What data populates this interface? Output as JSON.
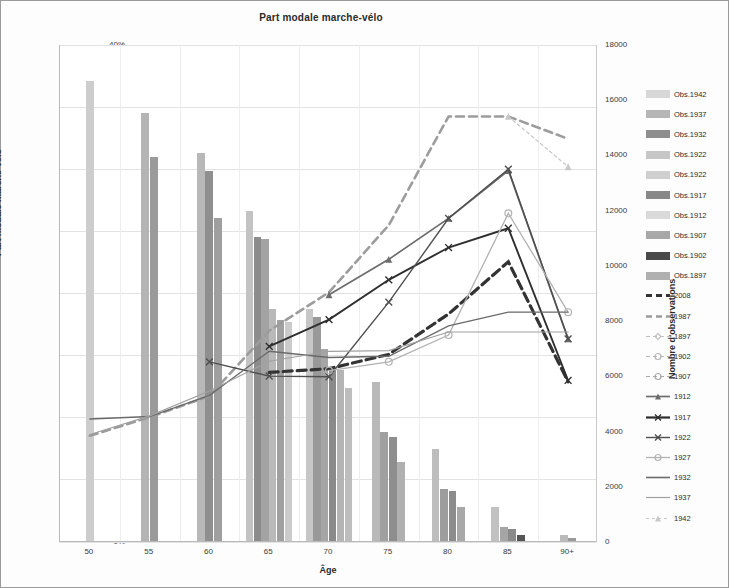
{
  "chart_data": {
    "type": "bar",
    "title": "Part modale marche-vélo",
    "xlabel": "Âge",
    "ylabel": "Part modale marche-vélo",
    "y2label": "Nombre d'observations",
    "categories": [
      "50",
      "55",
      "60",
      "65",
      "70",
      "75",
      "80",
      "85",
      "90+"
    ],
    "ylim": [
      0,
      0.4
    ],
    "ytick_labels": [
      "0%",
      "5%",
      "10%",
      "15%",
      "20%",
      "25%",
      "30%",
      "35%",
      "40%"
    ],
    "ytick_values": [
      0,
      0.05,
      0.1,
      0.15,
      0.2,
      0.25,
      0.3,
      0.35,
      0.4
    ],
    "y2lim": [
      0,
      18000
    ],
    "y2tick_labels": [
      "0",
      "2000",
      "4000",
      "6000",
      "8000",
      "10000",
      "12000",
      "14000",
      "16000",
      "18000"
    ],
    "y2tick_values": [
      0,
      2000,
      4000,
      6000,
      8000,
      10000,
      12000,
      14000,
      16000,
      18000
    ],
    "grid": true,
    "legend_position": "right",
    "bar_series": [
      {
        "name": "Obs.1942",
        "color": "#d7d7d7",
        "values": [
          16650,
          0,
          0,
          0,
          0,
          0,
          0,
          0,
          0
        ]
      },
      {
        "name": "Obs.1937",
        "color": "#b6b6b6",
        "values": [
          0,
          15500,
          0,
          0,
          0,
          0,
          0,
          0,
          0
        ]
      },
      {
        "name": "Obs.1932",
        "color": "#8e8e8e",
        "values": [
          0,
          13900,
          13400,
          0,
          0,
          0,
          0,
          0,
          0
        ]
      },
      {
        "name": "Obs.1927",
        "color": "#c6c6c6",
        "values": [
          0,
          0,
          14050,
          11700,
          0,
          0,
          0,
          0,
          0
        ]
      },
      {
        "name": "Obs.1922",
        "color": "#cfcfcf",
        "values": [
          0,
          0,
          11700,
          11950,
          0,
          0,
          0,
          0,
          0
        ]
      },
      {
        "name": "Obs.1917",
        "color": "#888888",
        "values": [
          0,
          0,
          0,
          11000,
          8400,
          0,
          0,
          0,
          0
        ]
      },
      {
        "name": "Obs.1912",
        "color": "#dadada",
        "values": [
          0,
          0,
          0,
          8000,
          8100,
          0,
          0,
          0,
          0
        ]
      },
      {
        "name": "Obs.1907",
        "color": "#a8a8a8",
        "values": [
          0,
          0,
          0,
          7950,
          6900,
          5750,
          0,
          0,
          0
        ]
      },
      {
        "name": "Obs.1902",
        "color": "#4a4a4a",
        "values": [
          0,
          0,
          0,
          0,
          6250,
          3950,
          1250,
          200,
          0
        ]
      },
      {
        "name": "Obs.1897",
        "color": "#b0b0b0",
        "values": [
          0,
          0,
          0,
          0,
          5550,
          3750,
          1900,
          500,
          100
        ]
      }
    ],
    "bar_groups": [
      {
        "category": "50",
        "bars": [
          {
            "value": 16650,
            "color": "#cdcdcd"
          }
        ]
      },
      {
        "category": "55",
        "bars": [
          {
            "value": 15500,
            "color": "#b4b4b4"
          },
          {
            "value": 13900,
            "color": "#9a9a9a"
          }
        ]
      },
      {
        "category": "60",
        "bars": [
          {
            "value": 14050,
            "color": "#b8b8b8"
          },
          {
            "value": 13400,
            "color": "#8f8f8f"
          },
          {
            "value": 11700,
            "color": "#9f9f9f"
          }
        ]
      },
      {
        "category": "65",
        "bars": [
          {
            "value": 11950,
            "color": "#c3c3c3"
          },
          {
            "value": 11000,
            "color": "#8c8c8c"
          },
          {
            "value": 10950,
            "color": "#a3a3a3"
          },
          {
            "value": 8400,
            "color": "#b9b9b9"
          },
          {
            "value": 8000,
            "color": "#a0a0a0"
          },
          {
            "value": 7950,
            "color": "#cbcbcb"
          }
        ]
      },
      {
        "category": "70",
        "bars": [
          {
            "value": 8400,
            "color": "#c6c6c6"
          },
          {
            "value": 8100,
            "color": "#999999"
          },
          {
            "value": 6950,
            "color": "#a5a5a5"
          },
          {
            "value": 6250,
            "color": "#8a8a8a"
          },
          {
            "value": 6200,
            "color": "#b4b4b4"
          },
          {
            "value": 5550,
            "color": "#bdbdbd"
          }
        ]
      },
      {
        "category": "75",
        "bars": [
          {
            "value": 5750,
            "color": "#b9b9b9"
          },
          {
            "value": 3950,
            "color": "#a0a0a0"
          },
          {
            "value": 3750,
            "color": "#8e8e8e"
          },
          {
            "value": 2850,
            "color": "#b0b0b0"
          }
        ]
      },
      {
        "category": "80",
        "bars": [
          {
            "value": 3350,
            "color": "#bdbdbd"
          },
          {
            "value": 1900,
            "color": "#9d9d9d"
          },
          {
            "value": 1800,
            "color": "#8c8c8c"
          },
          {
            "value": 1250,
            "color": "#a8a8a8"
          }
        ]
      },
      {
        "category": "85",
        "bars": [
          {
            "value": 1250,
            "color": "#c1c1c1"
          },
          {
            "value": 500,
            "color": "#a5a5a5"
          },
          {
            "value": 420,
            "color": "#8a8a8a"
          },
          {
            "value": 200,
            "color": "#555555"
          }
        ]
      },
      {
        "category": "90+",
        "bars": [
          {
            "value": 200,
            "color": "#bbbbbb"
          },
          {
            "value": 120,
            "color": "#9a9a9a"
          }
        ]
      }
    ],
    "line_series": [
      {
        "name": "2008",
        "color": "#333333",
        "width": 3.2,
        "dash": "9,5",
        "marker": "none",
        "values": [
          null,
          null,
          null,
          0.1365,
          0.1395,
          0.151,
          0.1835,
          0.2255,
          0.129
        ]
      },
      {
        "name": "1987",
        "color": "#9c9c9c",
        "width": 2.6,
        "dash": "8,5",
        "marker": "none",
        "values": [
          0.0855,
          0.1005,
          0.1175,
          0.17,
          0.201,
          0.255,
          0.3425,
          0.3425,
          0.3245
        ]
      },
      {
        "name": "1897",
        "color": "#c0c0c0",
        "width": 1.1,
        "dash": "5,3",
        "marker": "diamond",
        "values": [
          null,
          null,
          null,
          null,
          null,
          null,
          null,
          null,
          null
        ]
      },
      {
        "name": "1902",
        "color": "#b5b5b5",
        "width": 1.1,
        "dash": "5,3",
        "marker": "circle",
        "values": [
          null,
          null,
          null,
          null,
          null,
          null,
          null,
          null,
          null
        ]
      },
      {
        "name": "1907",
        "color": "#a9a9a9",
        "width": 1.1,
        "dash": "5,3",
        "marker": "circle",
        "values": [
          null,
          null,
          null,
          null,
          null,
          null,
          null,
          null,
          null
        ]
      },
      {
        "name": "1912",
        "color": "#6d6d6d",
        "width": 1.7,
        "dash": "none",
        "marker": "triangle",
        "values": [
          null,
          null,
          null,
          null,
          0.199,
          0.2275,
          0.2605,
          0.299,
          0.1635
        ]
      },
      {
        "name": "1917",
        "color": "#2e2e2e",
        "width": 1.9,
        "dash": "none",
        "marker": "x",
        "values": [
          null,
          null,
          null,
          0.1575,
          0.179,
          0.211,
          0.237,
          0.2525,
          0.13
        ]
      },
      {
        "name": "1922",
        "color": "#4f4f4f",
        "width": 1.4,
        "dash": "none",
        "marker": "x",
        "values": [
          null,
          null,
          0.145,
          0.1335,
          0.133,
          0.193,
          0.2605,
          0.3,
          0.1635
        ]
      },
      {
        "name": "1927",
        "color": "#b2b2b2",
        "width": 1.3,
        "dash": "none",
        "marker": "circle",
        "values": [
          null,
          null,
          null,
          null,
          0.138,
          0.145,
          0.1665,
          0.2645,
          0.185
        ]
      },
      {
        "name": "1932",
        "color": "#6a6a6a",
        "width": 1.3,
        "dash": "none",
        "marker": "none",
        "values": [
          0.099,
          0.101,
          0.118,
          0.1535,
          0.1485,
          0.1495,
          0.174,
          0.185,
          0.185
        ]
      },
      {
        "name": "1937",
        "color": "#a0a0a0",
        "width": 1.2,
        "dash": "none",
        "marker": "none",
        "values": [
          0.0865,
          0.1015,
          0.1215,
          0.1455,
          0.1535,
          0.154,
          0.169,
          0.169,
          0.169
        ]
      },
      {
        "name": "1942",
        "color": "#c8c8c8",
        "width": 1.2,
        "dash": "3,3",
        "marker": "triangle",
        "values": [
          null,
          null,
          null,
          null,
          null,
          null,
          null,
          0.3425,
          0.302
        ]
      }
    ]
  },
  "legend": {
    "items": [
      {
        "label": "Obs.1942",
        "kind": "swatch",
        "color": "#d7d7d7"
      },
      {
        "label": "Obs.1937",
        "kind": "swatch",
        "color": "#b6b6b6"
      },
      {
        "label": "Obs.1932",
        "kind": "swatch",
        "color": "#8e8e8e"
      },
      {
        "label": "Obs.1922",
        "kind": "swatch",
        "color": "#c6c6c6"
      },
      {
        "label": "Obs.1922",
        "kind": "swatch",
        "color": "#cfcfcf"
      },
      {
        "label": "Obs.1917",
        "kind": "swatch",
        "color": "#888888"
      },
      {
        "label": "Obs.1912",
        "kind": "swatch",
        "color": "#dadada"
      },
      {
        "label": "Obs.1907",
        "kind": "swatch",
        "color": "#a8a8a8"
      },
      {
        "label": "Obs.1902",
        "kind": "swatch",
        "color": "#4a4a4a"
      },
      {
        "label": "Obs.1897",
        "kind": "swatch",
        "color": "#b0b0b0"
      },
      {
        "label": "2008",
        "kind": "line",
        "color": "#333333",
        "width": 3.2,
        "dash": "6,4",
        "marker": "none"
      },
      {
        "label": "1987",
        "kind": "line",
        "color": "#9c9c9c",
        "width": 2.6,
        "dash": "6,4",
        "marker": "none"
      },
      {
        "label": "1897",
        "kind": "line",
        "color": "#c0c0c0",
        "width": 1.1,
        "dash": "4,3",
        "marker": "diamond"
      },
      {
        "label": "1902",
        "kind": "line",
        "color": "#b5b5b5",
        "width": 1.1,
        "dash": "4,3",
        "marker": "circle"
      },
      {
        "label": "1907",
        "kind": "line",
        "color": "#a9a9a9",
        "width": 1.1,
        "dash": "4,3",
        "marker": "circle"
      },
      {
        "label": "1912",
        "kind": "line",
        "color": "#6d6d6d",
        "width": 1.7,
        "dash": "none",
        "marker": "triangle"
      },
      {
        "label": "1917",
        "kind": "line",
        "color": "#2e2e2e",
        "width": 2.2,
        "dash": "none",
        "marker": "x"
      },
      {
        "label": "1922",
        "kind": "line",
        "color": "#4f4f4f",
        "width": 1.4,
        "dash": "none",
        "marker": "x"
      },
      {
        "label": "1927",
        "kind": "line",
        "color": "#b2b2b2",
        "width": 1.3,
        "dash": "none",
        "marker": "circle"
      },
      {
        "label": "1932",
        "kind": "line",
        "color": "#6a6a6a",
        "width": 1.6,
        "dash": "none",
        "marker": "none"
      },
      {
        "label": "1937",
        "kind": "line",
        "color": "#a0a0a0",
        "width": 1.2,
        "dash": "none",
        "marker": "none"
      },
      {
        "label": "1942",
        "kind": "line",
        "color": "#c8c8c8",
        "width": 1.2,
        "dash": "3,3",
        "marker": "triangle"
      }
    ]
  }
}
